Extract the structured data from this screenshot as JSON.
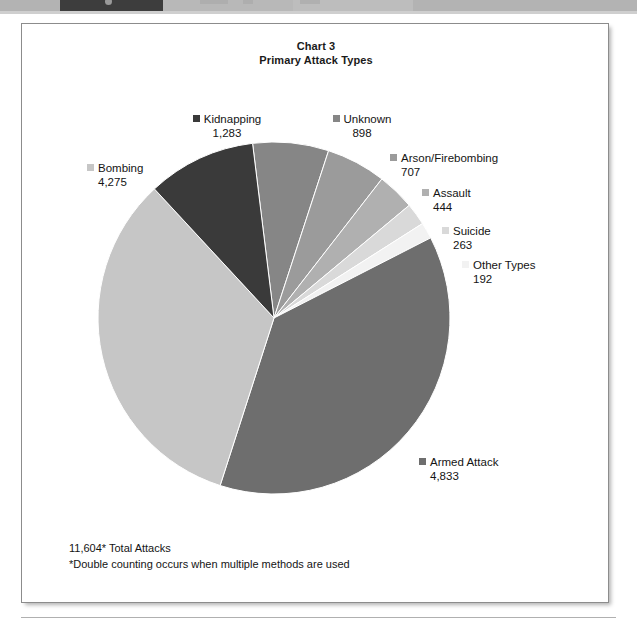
{
  "topbar": {
    "active_tab_label": "",
    "other_tab_label": "",
    "third_tab_label": ""
  },
  "chart_title": {
    "line1": "Chart 3",
    "line2": "Primary Attack Types"
  },
  "footnotes": {
    "total": "11,604* Total Attacks",
    "note": "*Double counting occurs when multiple methods are used"
  },
  "colors": {
    "armed_attack": "#6e6e6e",
    "bombing": "#c6c6c6",
    "kidnapping": "#3a3a3a",
    "unknown": "#868686",
    "arson": "#9b9b9b",
    "assault": "#b0b0b0",
    "suicide": "#d9d9d9",
    "other_types": "#f2f2f2",
    "frame_border": "#8c8c8c",
    "page_background": "#ffffff"
  },
  "chart_data": {
    "type": "pie",
    "xlabel": "",
    "ylabel": "",
    "total": 11604,
    "total_label": "11,604* Total Attacks",
    "annotation": "*Double counting occurs when multiple methods are used",
    "legend_position": "callout-labels",
    "grid": false,
    "start_angle_deg": 97,
    "direction": "clockwise",
    "categories": [
      "Unknown",
      "Arson/Firebombing",
      "Assault",
      "Suicide",
      "Other Types",
      "Armed Attack",
      "Bombing",
      "Kidnapping"
    ],
    "values": [
      898,
      707,
      444,
      263,
      192,
      4833,
      4275,
      1283
    ],
    "slices": [
      {
        "label": "Unknown",
        "value": 898,
        "value_label": "898",
        "color": "#868686"
      },
      {
        "label": "Arson/Firebombing",
        "value": 707,
        "value_label": "707",
        "color": "#9b9b9b"
      },
      {
        "label": "Assault",
        "value": 444,
        "value_label": "444",
        "color": "#b0b0b0"
      },
      {
        "label": "Suicide",
        "value": 263,
        "value_label": "263",
        "color": "#d9d9d9"
      },
      {
        "label": "Other Types",
        "value": 192,
        "value_label": "192",
        "color": "#f2f2f2"
      },
      {
        "label": "Armed Attack",
        "value": 4833,
        "value_label": "4,833",
        "color": "#6e6e6e"
      },
      {
        "label": "Bombing",
        "value": 4275,
        "value_label": "4,275",
        "color": "#c6c6c6"
      },
      {
        "label": "Kidnapping",
        "value": 1283,
        "value_label": "1,283",
        "color": "#3a3a3a"
      }
    ]
  }
}
